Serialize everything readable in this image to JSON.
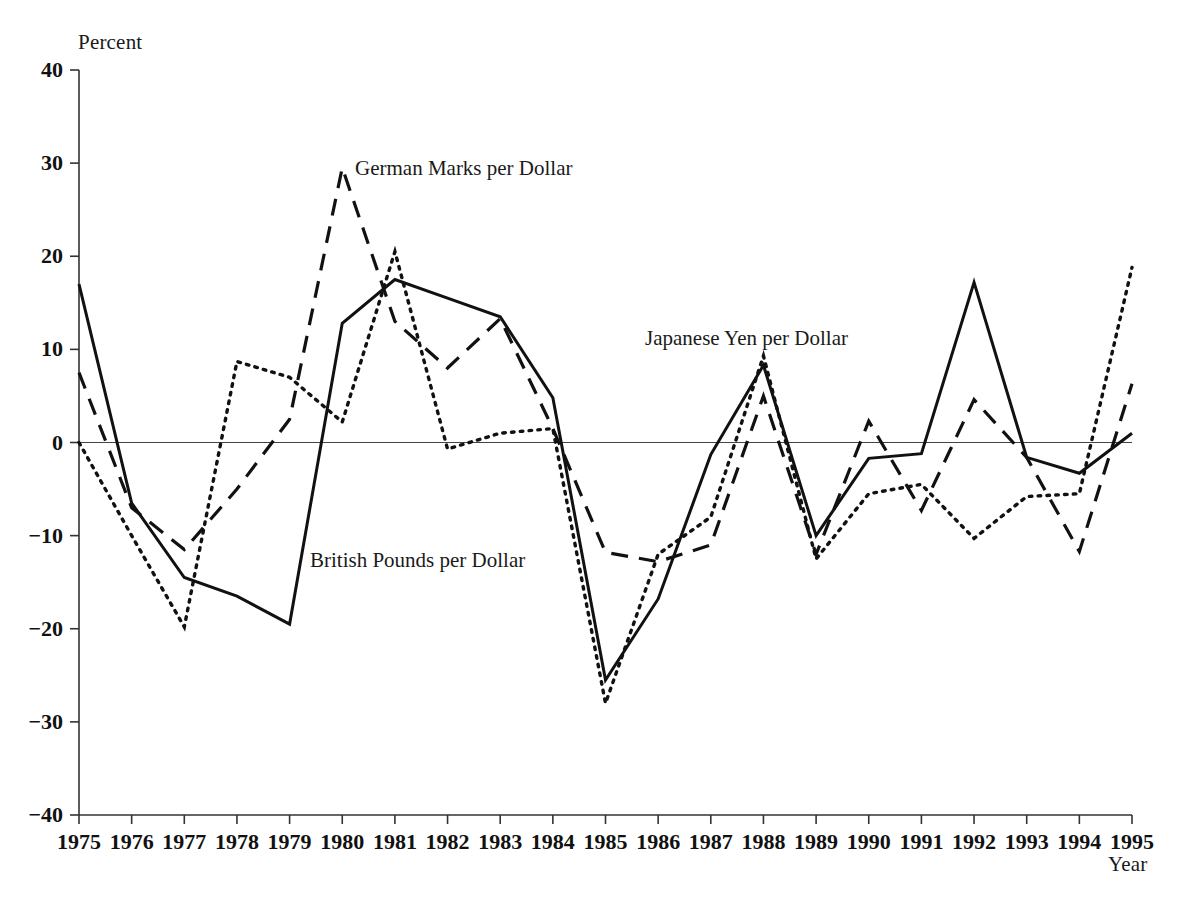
{
  "chart_data": {
    "type": "line",
    "title": "",
    "xlabel": "Year",
    "ylabel": "Percent",
    "xlim": [
      1975,
      1995
    ],
    "ylim": [
      -40,
      40
    ],
    "grid": false,
    "legend_position": "inline-annotations",
    "x": [
      1975,
      1976,
      1977,
      1978,
      1979,
      1980,
      1981,
      1982,
      1983,
      1984,
      1985,
      1986,
      1987,
      1988,
      1989,
      1990,
      1991,
      1992,
      1993,
      1994,
      1995
    ],
    "xtick_labels": [
      "1975",
      "1976",
      "1977",
      "1978",
      "1979",
      "1980",
      "1981",
      "1982",
      "1983",
      "1984",
      "1985",
      "1986",
      "1987",
      "1988",
      "1989",
      "1990",
      "1991",
      "1992",
      "1993",
      "1994",
      "1995"
    ],
    "ytick_labels": [
      "40",
      "30",
      "20",
      "10",
      "0",
      "−10",
      "−20",
      "−30",
      "−40"
    ],
    "yticks": [
      40,
      30,
      20,
      10,
      0,
      -10,
      -20,
      -30,
      -40
    ],
    "series": [
      {
        "name": "British Pounds per Dollar",
        "style": "solid",
        "color": "#111111",
        "label_x": 1980.4,
        "label_y": -11.9,
        "values": [
          17.0,
          -6.5,
          -14.5,
          -16.5,
          -19.5,
          12.8,
          17.5,
          15.5,
          13.5,
          4.8,
          -25.5,
          -16.8,
          -1.3,
          8.3,
          -10.0,
          -1.7,
          -1.2,
          17.2,
          -1.6,
          -3.3,
          1.0
        ]
      },
      {
        "name": "German Marks per Dollar",
        "style": "dashed",
        "color": "#111111",
        "label_x": 1980.5,
        "label_y": 29.6,
        "values": [
          7.5,
          -7.0,
          -11.5,
          -5.0,
          2.5,
          29.5,
          13.0,
          8.0,
          13.3,
          1.5,
          -11.8,
          -12.8,
          -11.0,
          5.0,
          -12.0,
          2.3,
          -7.3,
          4.6,
          -1.6,
          -11.7,
          6.3
        ]
      },
      {
        "name": "Japanese Yen per Dollar",
        "style": "dotted",
        "color": "#111111",
        "label_x": 1986.7,
        "label_y": 11.8,
        "values": [
          0.0,
          -10.0,
          -19.8,
          8.7,
          7.0,
          2.2,
          20.5,
          -0.7,
          1.0,
          1.5,
          -28.0,
          -12.0,
          -8.0,
          9.3,
          -12.5,
          -5.5,
          -4.5,
          -10.3,
          -5.8,
          -5.5,
          18.8
        ]
      }
    ]
  },
  "axis_titles": {
    "y": "Percent",
    "x": "Year"
  },
  "annotations": [
    {
      "id": "german",
      "text": "German Marks per Dollar"
    },
    {
      "id": "british",
      "text": "British Pounds per Dollar"
    },
    {
      "id": "japanese",
      "text": "Japanese Yen per Dollar"
    }
  ]
}
